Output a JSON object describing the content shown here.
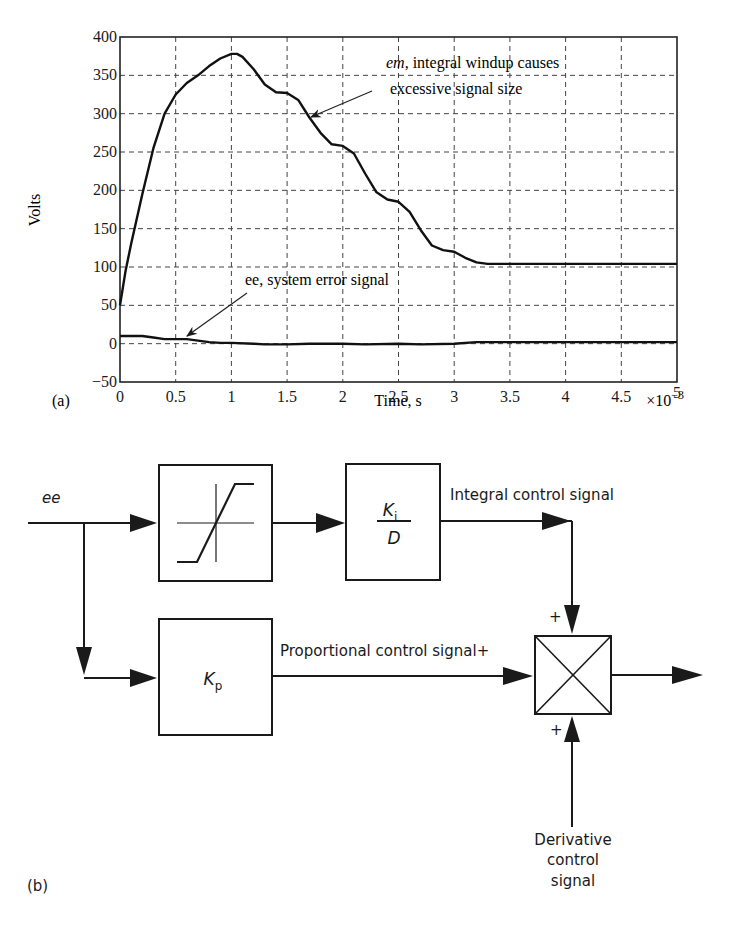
{
  "panel_a": {
    "label": "(a)",
    "chart_data": {
      "type": "line",
      "title": "",
      "xlabel": "Time, s",
      "x_scale_note": "×10",
      "x_scale_exp": "−3",
      "ylabel": "Volts",
      "xlim": [
        0,
        5
      ],
      "ylim": [
        -50,
        400
      ],
      "grid": true,
      "x_ticks": [
        "0",
        "0.5",
        "1",
        "1.5",
        "2",
        "2.5",
        "3",
        "3.5",
        "4",
        "4.5",
        "5"
      ],
      "y_ticks": [
        "400",
        "350",
        "300",
        "250",
        "200",
        "150",
        "100",
        "50",
        "0",
        "−50"
      ],
      "series": [
        {
          "name": "em",
          "x": [
            0,
            0.05,
            0.1,
            0.2,
            0.3,
            0.4,
            0.5,
            0.6,
            0.7,
            0.8,
            0.9,
            1.0,
            1.05,
            1.1,
            1.2,
            1.3,
            1.4,
            1.5,
            1.6,
            1.7,
            1.8,
            1.9,
            2.0,
            2.1,
            2.2,
            2.3,
            2.4,
            2.5,
            2.6,
            2.7,
            2.8,
            2.9,
            3.0,
            3.1,
            3.2,
            3.3,
            3.4,
            3.5,
            4.0,
            4.5,
            5.0
          ],
          "y": [
            50,
            95,
            130,
            195,
            255,
            300,
            325,
            340,
            350,
            362,
            372,
            378,
            378,
            374,
            358,
            338,
            328,
            327,
            318,
            295,
            275,
            260,
            258,
            248,
            222,
            198,
            188,
            185,
            172,
            148,
            128,
            122,
            120,
            112,
            106,
            104,
            104,
            104,
            104,
            104,
            104
          ]
        },
        {
          "name": "ee",
          "x": [
            0,
            0.2,
            0.3,
            0.4,
            0.5,
            0.6,
            0.7,
            0.8,
            0.9,
            1.0,
            1.2,
            1.3,
            1.5,
            1.7,
            2.0,
            2.2,
            2.5,
            2.7,
            3.0,
            3.2,
            3.5,
            4.0,
            4.5,
            5.0
          ],
          "y": [
            10,
            10,
            8,
            6,
            6,
            6,
            4,
            2,
            1,
            1,
            0,
            -1,
            -1,
            0,
            0,
            -1,
            0,
            -1,
            0,
            2,
            2,
            2,
            2,
            2
          ]
        }
      ],
      "annotations": [
        {
          "text_italic": "em",
          "text": ", integral windup causes",
          "text2": "excessive signal size",
          "points_to": [
            1.7,
            295
          ]
        },
        {
          "text": "ee, system error signal",
          "points_to": [
            0.55,
            6
          ]
        }
      ]
    }
  },
  "panel_b": {
    "label": "(b)",
    "input_label": "ee",
    "limiter_block": "saturation-limiter",
    "integral_block": {
      "numerator": "K",
      "numerator_sub": "i",
      "denominator": "D"
    },
    "proportional_block": {
      "label": "K",
      "label_sub": "p"
    },
    "integral_signal_label": "Integral control signal",
    "proportional_signal_label": "Proportional control signal+",
    "derivative_signal_label": [
      "Derivative",
      "control",
      "signal"
    ],
    "summer_signs": {
      "top": "+",
      "bottom": "+"
    }
  }
}
